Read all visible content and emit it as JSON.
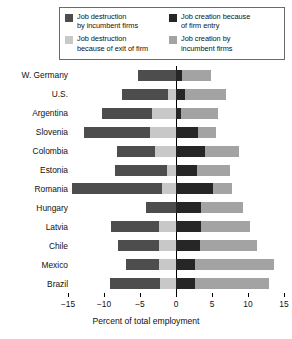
{
  "legend": {
    "entries": [
      {
        "key": "destruction_incumbent",
        "label": "Job destruction\nby incumbent firms",
        "color": "#4d4d4d"
      },
      {
        "key": "creation_entry",
        "label": "Job creation because\nof firm entry",
        "color": "#262626"
      },
      {
        "key": "destruction_exit",
        "label": "Job destruction\nbecause of exit of firm",
        "color": "#c8c8c8"
      },
      {
        "key": "creation_incumbent",
        "label": "Job creation by\nincumbent firms",
        "color": "#a3a3a3"
      }
    ]
  },
  "axis": {
    "x_label": "Percent of total employment",
    "x_ticks": [
      -15,
      -10,
      -5,
      0,
      5,
      10,
      15
    ],
    "x_tick_labels": [
      "−15",
      "−10",
      "−5",
      "0",
      "5",
      "10",
      "15"
    ]
  },
  "chart_data": {
    "type": "bar",
    "orientation": "horizontal",
    "stacked": true,
    "diverging": true,
    "title": "",
    "xlabel": "Percent of total employment",
    "ylabel": "",
    "xlim": [
      -15,
      15
    ],
    "grid": false,
    "legend_position": "top",
    "categories": [
      "W. Germany",
      "U.S.",
      "Argentina",
      "Slovenia",
      "Colombia",
      "Estonia",
      "Romania",
      "Hungary",
      "Latvia",
      "Chile",
      "Mexico",
      "Brazil"
    ],
    "series": [
      {
        "name": "Job destruction by incumbent firms",
        "color": "#4d4d4d",
        "side": "negative",
        "values": [
          -5.3,
          -6.4,
          -7.0,
          -9.2,
          -5.3,
          -7.2,
          -12.6,
          -4.2,
          -6.7,
          -5.6,
          -4.6,
          -7.0
        ]
      },
      {
        "name": "Job destruction because of exit of firm",
        "color": "#c8c8c8",
        "side": "negative",
        "values": [
          0.0,
          -1.1,
          -3.3,
          -3.6,
          -2.9,
          -1.3,
          -1.9,
          0.0,
          -2.3,
          -2.4,
          -2.3,
          -2.2
        ]
      },
      {
        "name": "Job creation because of firm entry",
        "color": "#262626",
        "side": "positive",
        "values": [
          0.8,
          1.2,
          0.7,
          3.0,
          4.0,
          2.9,
          5.2,
          3.5,
          3.5,
          3.3,
          2.6,
          2.6
        ]
      },
      {
        "name": "Job creation by incumbent firms",
        "color": "#a3a3a3",
        "side": "positive",
        "values": [
          4.1,
          5.7,
          5.2,
          2.5,
          4.8,
          4.6,
          2.6,
          5.8,
          6.8,
          8.0,
          11.0,
          10.3
        ]
      }
    ]
  }
}
